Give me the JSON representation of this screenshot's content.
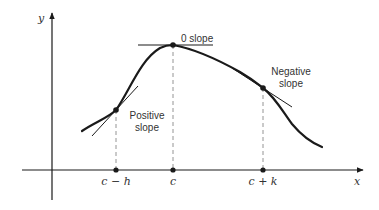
{
  "diagram": {
    "type": "function-slope-illustration",
    "axes": {
      "x_label": "x",
      "y_label": "y"
    },
    "points": [
      {
        "id": "c-minus-h",
        "x_label": "c − h",
        "annotation_line1": "Positive",
        "annotation_line2": "slope"
      },
      {
        "id": "c",
        "x_label": "c",
        "annotation": "0 slope"
      },
      {
        "id": "c-plus-k",
        "x_label": "c + k",
        "annotation_line1": "Negative",
        "annotation_line2": "slope"
      }
    ],
    "colors": {
      "curve": "#1a1a1a",
      "axes": "#1a1a1a",
      "dashed": "#888888",
      "text": "#333333"
    }
  }
}
